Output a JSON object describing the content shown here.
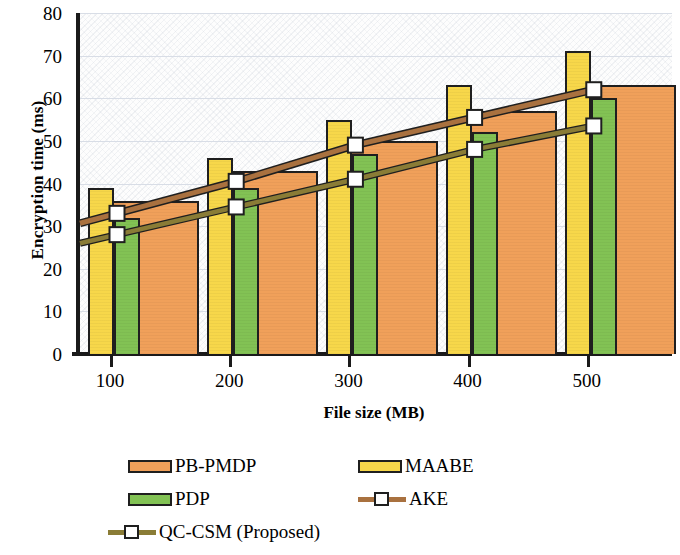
{
  "chart_data": {
    "type": "bar",
    "title": "",
    "xlabel": "File size (MB)",
    "ylabel": "Encryption time (ms)",
    "categories": [
      "100",
      "200",
      "300",
      "400",
      "500"
    ],
    "x": [
      100,
      200,
      300,
      400,
      500
    ],
    "ylim": [
      0,
      80
    ],
    "yticks": [
      0,
      10,
      20,
      30,
      40,
      50,
      60,
      70,
      80
    ],
    "xticklabels": [
      "100",
      "200",
      "300",
      "400",
      "500"
    ],
    "grid": true,
    "legend_position": "bottom",
    "series": [
      {
        "name": "PB-PMDP",
        "kind": "bar",
        "color": "#f0a05a",
        "values": [
          36,
          43,
          50,
          57,
          63
        ]
      },
      {
        "name": "MAABE",
        "kind": "bar",
        "color": "#f7d74a",
        "values": [
          39,
          46,
          55,
          63,
          71
        ]
      },
      {
        "name": "PDP",
        "kind": "bar",
        "color": "#82c254",
        "values": [
          32,
          39,
          47,
          52,
          60
        ]
      },
      {
        "name": "AKE",
        "kind": "line",
        "color": "#a9713f",
        "values": [
          33,
          40.5,
          49,
          55.5,
          62
        ]
      },
      {
        "name": "QC-CSM (Proposed)",
        "kind": "line",
        "color": "#8a7c36",
        "values": [
          28,
          34.5,
          41,
          48,
          53.5
        ]
      }
    ]
  },
  "axes": {
    "y_title": "Encryption time (ms)",
    "x_title": "File size (MB)",
    "y_ticks": [
      "80",
      "70",
      "60",
      "50",
      "40",
      "30",
      "20",
      "10",
      "0"
    ],
    "x_ticks": [
      "100",
      "200",
      "300",
      "400",
      "500"
    ]
  },
  "legend": {
    "items": [
      {
        "label": "PB-PMDP",
        "type": "bar",
        "color": "#f0a05a"
      },
      {
        "label": "MAABE",
        "type": "bar",
        "color": "#f7d74a"
      },
      {
        "label": "PDP",
        "type": "bar",
        "color": "#82c254"
      },
      {
        "label": "AKE",
        "type": "line",
        "color": "#a9713f"
      },
      {
        "label": "QC-CSM (Proposed)",
        "type": "line",
        "color": "#8a7c36"
      }
    ]
  }
}
